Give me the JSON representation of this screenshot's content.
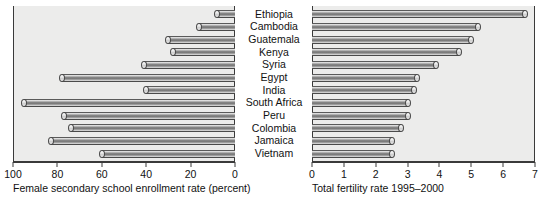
{
  "chart_data": {
    "type": "bar",
    "title": "",
    "subtitle": "",
    "orientation": "horizontal",
    "layout": "back-to-back paired bar chart (butterfly) with centered category labels",
    "categories": [
      "Ethiopia",
      "Cambodia",
      "Guatemala",
      "Kenya",
      "Syria",
      "Egypt",
      "India",
      "South Africa",
      "Peru",
      "Colombia",
      "Jamaica",
      "Vietnam"
    ],
    "series": [
      {
        "name": "Female secondary school enrollment rate (percent)",
        "panel": "left",
        "axis_direction": "reversed",
        "xlabel": "Female secondary school enrollment rate (percent)",
        "ylabel": "",
        "xlim": [
          100,
          0
        ],
        "ticks": [
          100,
          80,
          60,
          40,
          20,
          0
        ],
        "values": [
          8,
          16,
          30,
          28,
          41,
          78,
          40,
          95,
          77,
          74,
          83,
          60
        ]
      },
      {
        "name": "Total fertility rate 1995-2000",
        "panel": "right",
        "axis_direction": "normal",
        "xlabel": "Total fertility rate 1995-2000",
        "ylabel": "",
        "xlim": [
          0,
          7
        ],
        "ticks": [
          0,
          1,
          2,
          3,
          4,
          5,
          6,
          7
        ],
        "values": [
          6.7,
          5.2,
          5.0,
          4.6,
          3.9,
          3.3,
          3.2,
          3.0,
          3.0,
          2.8,
          2.5,
          2.5
        ]
      }
    ],
    "grid": false,
    "legend": "none",
    "annotations": []
  },
  "left_panel": {
    "caption": "Female secondary school enrollment rate (percent)",
    "tick_labels": [
      "100",
      "80",
      "60",
      "40",
      "20",
      "0"
    ]
  },
  "right_panel": {
    "caption": "Total fertility rate 1995–2000",
    "tick_labels": [
      "0",
      "1",
      "2",
      "3",
      "4",
      "5",
      "6",
      "7"
    ]
  },
  "colors": {
    "plot_background": "#ececeb",
    "page_background": "#ffffff",
    "axis": "#3a3a3a",
    "bar_dark": "#6e6e6e",
    "bar_light": "#f2f2f2",
    "text": "#111111"
  }
}
